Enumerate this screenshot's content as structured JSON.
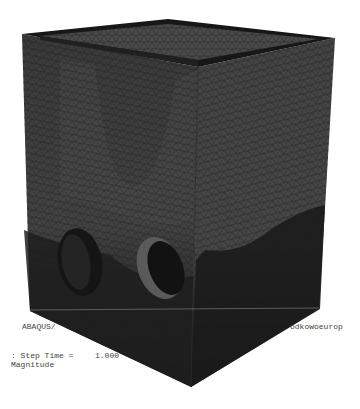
{
  "viewport": {
    "title_left": "ABAQUS/",
    "title_right": "odkowoeurop",
    "step_label": ": Step Time =",
    "step_value": "1.000",
    "variable_label": "Magnitude"
  },
  "model": {
    "type": "fea-mesh-box",
    "holes": 2,
    "colors": {
      "face_left": "#3c3c3c",
      "face_right": "#404040",
      "rim": "#1a1a1a",
      "inner_top": "#4a4a4a",
      "dark_bottom": "#141414",
      "light_band": "#5a5a5a",
      "mesh_line": "#1e1e1e"
    }
  }
}
